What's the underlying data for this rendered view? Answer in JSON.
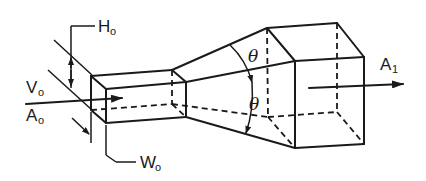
{
  "diagram": {
    "labels": {
      "height_inlet": {
        "main": "H",
        "sub": "o"
      },
      "width_inlet": {
        "main": "W",
        "sub": "o"
      },
      "velocity_inlet": {
        "main": "V",
        "sub": "o"
      },
      "area_inlet": {
        "main": "A",
        "sub": "o"
      },
      "area_outlet": {
        "main": "A",
        "sub": "1"
      },
      "angle_top": "θ",
      "angle_bottom": "θ"
    },
    "colors": {
      "line": "#1a1a1a",
      "background": "#ffffff"
    }
  }
}
